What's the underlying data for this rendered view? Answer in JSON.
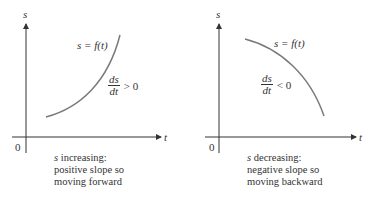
{
  "panels": [
    {
      "axis_y_label": "s",
      "axis_x_label": "t",
      "origin_label": "0",
      "curve_label": "s = f(t)",
      "derivative": {
        "numerator": "ds",
        "denominator": "dt",
        "relation": "> 0"
      },
      "caption": {
        "line1_var": "s",
        "line1_rest": " increasing:",
        "line2": "positive slope so",
        "line3": "moving forward"
      }
    },
    {
      "axis_y_label": "s",
      "axis_x_label": "t",
      "origin_label": "0",
      "curve_label": "s = f(t)",
      "derivative": {
        "numerator": "ds",
        "denominator": "dt",
        "relation": "< 0"
      },
      "caption": {
        "line1_var": "s",
        "line1_rest": " decreasing:",
        "line2": "negative slope so",
        "line3": "moving backward"
      }
    }
  ],
  "colors": {
    "axis": "#333333",
    "curve": "#7a7a7a",
    "text": "#333333"
  }
}
